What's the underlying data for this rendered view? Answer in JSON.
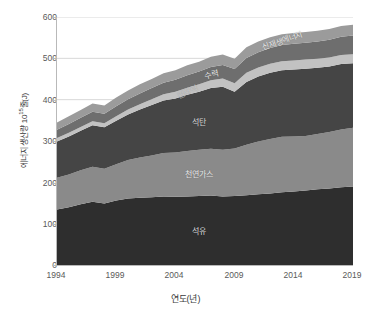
{
  "chart_data": {
    "type": "area",
    "stacked": true,
    "title": "",
    "xlabel": "연도(년)",
    "ylabel": "에너지 생산량 10¹⁵줄(J)",
    "ylabel_base": "에너지 생산량 10",
    "ylabel_exp": "15",
    "ylabel_tail": "줄(J)",
    "xlim": [
      1994,
      2019
    ],
    "ylim": [
      0,
      600
    ],
    "yticks": [
      0,
      100,
      200,
      300,
      400,
      500,
      600
    ],
    "xticks": [
      1994,
      1999,
      2004,
      2009,
      2014,
      2019
    ],
    "grid": "horizontal",
    "legend": "in-plot annotations",
    "x": [
      1994,
      1995,
      1996,
      1997,
      1998,
      1999,
      2000,
      2001,
      2002,
      2003,
      2004,
      2005,
      2006,
      2007,
      2008,
      2009,
      2010,
      2011,
      2012,
      2013,
      2014,
      2015,
      2016,
      2017,
      2018,
      2019
    ],
    "series": [
      {
        "name": "석유",
        "label": "석유",
        "color": "#2e2e2e",
        "values": [
          134,
          140,
          147,
          153,
          149,
          156,
          161,
          163,
          164,
          166,
          165,
          166,
          167,
          168,
          166,
          167,
          169,
          171,
          173,
          176,
          178,
          180,
          183,
          185,
          188,
          190
        ]
      },
      {
        "name": "천연가스",
        "label": "천연가스",
        "color": "#8a8a8a",
        "values": [
          77,
          79,
          82,
          85,
          84,
          88,
          93,
          97,
          101,
          105,
          107,
          110,
          112,
          113,
          113,
          115,
          122,
          128,
          132,
          134,
          133,
          132,
          134,
          137,
          140,
          142
        ]
      },
      {
        "name": "석탄",
        "label": "석탄",
        "color": "#454545",
        "values": [
          88,
          92,
          96,
          100,
          100,
          105,
          110,
          116,
          122,
          127,
          131,
          136,
          140,
          147,
          152,
          137,
          152,
          157,
          160,
          161,
          162,
          163,
          160,
          158,
          158,
          156
        ]
      },
      {
        "name": "원자력",
        "label": "원자력",
        "color": "#c2c2c2",
        "values": [
          8,
          9,
          9,
          10,
          10,
          11,
          12,
          13,
          14,
          15,
          16,
          17,
          18,
          19,
          20,
          21,
          22,
          22,
          22,
          22,
          22,
          22,
          22,
          22,
          22,
          22
        ]
      },
      {
        "name": "수력",
        "label": "수력",
        "color": "#6e6e6e",
        "values": [
          20,
          21,
          22,
          23,
          23,
          24,
          25,
          26,
          27,
          28,
          29,
          30,
          31,
          32,
          33,
          34,
          36,
          37,
          38,
          39,
          40,
          41,
          42,
          43,
          44,
          45
        ]
      },
      {
        "name": "신재생에너지",
        "label": "신재생에너지",
        "color": "#9b9b9b",
        "values": [
          18,
          19,
          19,
          20,
          20,
          21,
          21,
          22,
          22,
          23,
          23,
          24,
          24,
          25,
          25,
          25,
          26,
          26,
          26,
          26,
          26,
          26,
          26,
          26,
          26,
          26
        ]
      }
    ],
    "annotations": [
      {
        "name": "label-renewable",
        "text": "신재생에너지",
        "rotate": -19
      },
      {
        "name": "label-hydro",
        "text": "수력",
        "rotate": -12
      },
      {
        "name": "label-nuclear",
        "text": "원자력",
        "rotate": -25
      },
      {
        "name": "label-coal",
        "text": "석탄",
        "rotate": 0
      },
      {
        "name": "label-gas",
        "text": "천연가스",
        "rotate": 0
      },
      {
        "name": "label-oil",
        "text": "석유",
        "rotate": 0
      }
    ]
  },
  "axes": {
    "y_title_base": "에너지 생산량 10",
    "y_title_exp": "15",
    "y_title_tail": "줄(J)",
    "x_title": "연도(년)",
    "ytick_0": "0",
    "ytick_100": "100",
    "ytick_200": "200",
    "ytick_300": "300",
    "ytick_400": "400",
    "ytick_500": "500",
    "ytick_600": "600",
    "xtick_1994": "1994",
    "xtick_1999": "1999",
    "xtick_2004": "2004",
    "xtick_2009": "2009",
    "xtick_2014": "2014",
    "xtick_2019": "2019"
  },
  "labels": {
    "oil": "석유",
    "gas": "천연가스",
    "coal": "석탄",
    "nuclear": "원자력",
    "hydro": "수력",
    "renewable": "신재생에너지"
  }
}
